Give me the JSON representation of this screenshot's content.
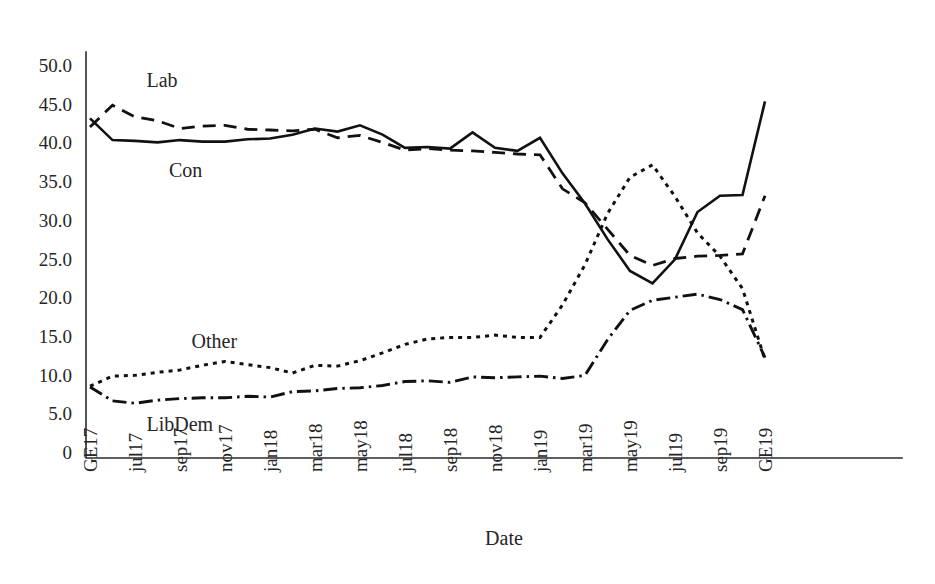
{
  "chart_data": {
    "type": "line",
    "title": "",
    "subtitle": "",
    "xlabel": "Date",
    "ylabel": "",
    "grid": false,
    "legend_position": "inline-annotations",
    "ylim": [
      0,
      52
    ],
    "ytick_labels": [
      "50.0",
      "45.0",
      "40.0",
      "35.0",
      "30.0",
      "25.0",
      "20.0",
      "15.0",
      "10.0",
      "5.0",
      "0"
    ],
    "ytick_values": [
      50,
      45,
      40,
      35,
      30,
      25,
      20,
      15,
      10,
      5,
      0
    ],
    "xtick_labels": [
      "GE17",
      "jul17",
      "sep17",
      "nov17",
      "jan18",
      "mar18",
      "may18",
      "jul18",
      "sep18",
      "nov18",
      "jan19",
      "mar19",
      "may19",
      "jul19",
      "sep19",
      "GE19"
    ],
    "x": [
      "GE17",
      "jun17",
      "jul17",
      "aug17",
      "sep17",
      "oct17",
      "nov17",
      "dec17",
      "jan18",
      "feb18",
      "mar18",
      "apr18",
      "may18",
      "jun18",
      "jul18",
      "aug18",
      "sep18",
      "oct18",
      "nov18",
      "dec18",
      "jan19",
      "feb19",
      "mar19",
      "apr19",
      "may19",
      "jun19",
      "jul19",
      "aug19",
      "sep19",
      "oct19",
      "GE19"
    ],
    "x_tick_every": 2,
    "series": [
      {
        "name": "Con",
        "line_style": "solid",
        "color": "#111111",
        "label_annotation": "Con",
        "values": [
          43.1,
          40.3,
          40.2,
          40.0,
          40.3,
          40.1,
          40.1,
          40.4,
          40.5,
          41.0,
          41.8,
          41.4,
          42.2,
          41.0,
          39.3,
          39.4,
          39.2,
          41.3,
          39.3,
          38.9,
          40.6,
          36.0,
          32.1,
          27.5,
          23.4,
          21.8,
          24.9,
          31.0,
          33.1,
          33.2,
          45.3
        ]
      },
      {
        "name": "Lab",
        "line_style": "dashed",
        "color": "#111111",
        "label_annotation": "Lab",
        "values": [
          42.0,
          44.8,
          43.3,
          42.8,
          41.8,
          42.1,
          42.2,
          41.7,
          41.6,
          41.5,
          41.7,
          40.6,
          40.9,
          40.0,
          39.0,
          39.2,
          39.0,
          38.9,
          38.7,
          38.5,
          38.4,
          34.0,
          32.2,
          28.8,
          25.4,
          24.1,
          25.0,
          25.3,
          25.4,
          25.6,
          33.1
        ]
      },
      {
        "name": "Other",
        "line_style": "dotted",
        "color": "#111111",
        "label_annotation": "Other",
        "values": [
          8.5,
          9.8,
          9.9,
          10.3,
          10.6,
          11.2,
          11.7,
          11.3,
          10.9,
          10.2,
          11.2,
          11.1,
          11.8,
          12.8,
          13.9,
          14.6,
          14.8,
          14.8,
          15.1,
          14.8,
          14.8,
          19.0,
          24.2,
          30.8,
          35.5,
          37.1,
          33.0,
          28.3,
          25.3,
          21.1,
          11.9
        ]
      },
      {
        "name": "LibDem",
        "line_style": "dashdot",
        "color": "#111111",
        "label_annotation": "LibDem",
        "values": [
          8.4,
          6.6,
          6.3,
          6.7,
          6.9,
          7.0,
          7.0,
          7.2,
          7.1,
          7.8,
          7.9,
          8.2,
          8.3,
          8.6,
          9.1,
          9.2,
          9.0,
          9.7,
          9.6,
          9.7,
          9.8,
          9.5,
          9.9,
          14.5,
          18.3,
          19.6,
          20.0,
          20.4,
          19.7,
          18.4,
          12.2
        ]
      }
    ],
    "annotations": [
      {
        "text": "Lab",
        "data_x": "jun17",
        "data_y": 48.0
      },
      {
        "text": "Con",
        "data_x": "jul17",
        "data_y": 36.4
      },
      {
        "text": "Other",
        "data_x": "aug17",
        "data_y": 14.3
      },
      {
        "text": "LibDem",
        "data_x": "jun17",
        "data_y": 3.6
      }
    ]
  }
}
